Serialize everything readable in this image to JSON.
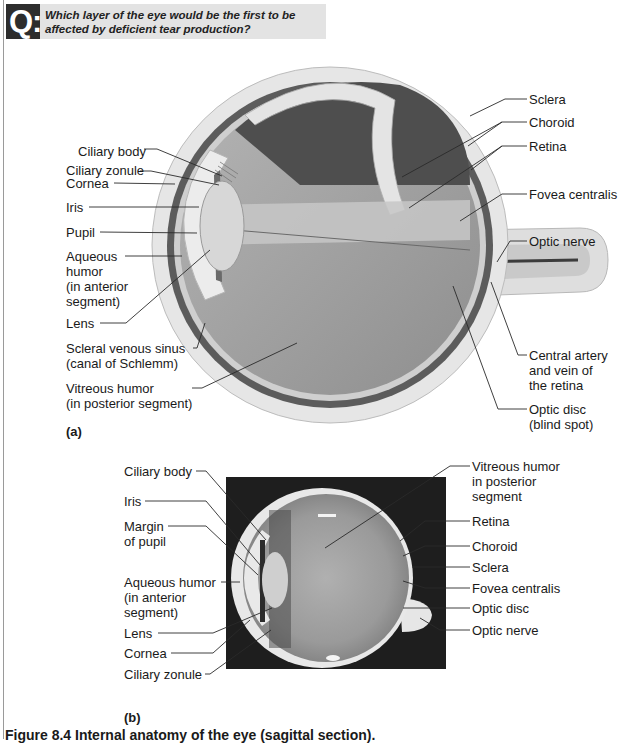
{
  "question": {
    "badge": "Q:",
    "text_line1": "Which layer of the eye would be the first to be",
    "text_line2": "affected by deficient tear production?"
  },
  "figure_a": {
    "panel_label": "(a)",
    "labels_left": [
      {
        "id": "ciliary-body",
        "text": "Ciliary body",
        "x": 78,
        "y": 144
      },
      {
        "id": "ciliary-zonule",
        "text": "Ciliary zonule",
        "x": 66,
        "y": 166
      },
      {
        "id": "cornea",
        "text": "Cornea",
        "x": 66,
        "y": 178
      },
      {
        "id": "iris",
        "text": "Iris",
        "x": 66,
        "y": 202
      },
      {
        "id": "pupil",
        "text": "Pupil",
        "x": 66,
        "y": 228
      },
      {
        "id": "aqueous-humor",
        "text": "Aqueous\nhumor\n(in anterior\nsegment)",
        "x": 66,
        "y": 251
      },
      {
        "id": "lens",
        "text": "Lens",
        "x": 66,
        "y": 318
      },
      {
        "id": "scleral-venous-sinus",
        "text": "Scleral venous sinus\n(canal of Schlemm)",
        "x": 66,
        "y": 343
      },
      {
        "id": "vitreous-humor",
        "text": "Vitreous humor\n(in posterior segment)",
        "x": 66,
        "y": 383
      }
    ],
    "labels_right": [
      {
        "id": "sclera",
        "text": "Sclera",
        "x": 529,
        "y": 94
      },
      {
        "id": "choroid",
        "text": "Choroid",
        "x": 529,
        "y": 117
      },
      {
        "id": "retina",
        "text": "Retina",
        "x": 529,
        "y": 141
      },
      {
        "id": "fovea-centralis",
        "text": "Fovea centralis",
        "x": 529,
        "y": 189
      },
      {
        "id": "optic-nerve",
        "text": "Optic nerve",
        "x": 529,
        "y": 236
      },
      {
        "id": "central-artery-vein",
        "text": "Central artery\nand vein of\nthe retina",
        "x": 529,
        "y": 350
      },
      {
        "id": "optic-disc",
        "text": "Optic disc\n(blind spot)",
        "x": 529,
        "y": 404
      }
    ]
  },
  "figure_b": {
    "panel_label": "(b)",
    "labels_left": [
      {
        "id": "ciliary-body",
        "text": "Ciliary body",
        "x": 124,
        "y": 466
      },
      {
        "id": "iris",
        "text": "Iris",
        "x": 124,
        "y": 496
      },
      {
        "id": "margin-of-pupil",
        "text": "Margin\nof pupil",
        "x": 124,
        "y": 521
      },
      {
        "id": "aqueous-humor",
        "text": "Aqueous humor\n(in anterior\nsegment)",
        "x": 124,
        "y": 577
      },
      {
        "id": "lens",
        "text": "Lens",
        "x": 124,
        "y": 628
      },
      {
        "id": "cornea",
        "text": "Cornea",
        "x": 124,
        "y": 648
      },
      {
        "id": "ciliary-zonule",
        "text": "Ciliary zonule",
        "x": 124,
        "y": 669
      }
    ],
    "labels_right": [
      {
        "id": "vitreous-humor",
        "text": "Vitreous humor\nin posterior\nsegment",
        "x": 472,
        "y": 461
      },
      {
        "id": "retina",
        "text": "Retina",
        "x": 472,
        "y": 516
      },
      {
        "id": "choroid",
        "text": "Choroid",
        "x": 472,
        "y": 541
      },
      {
        "id": "sclera",
        "text": "Sclera",
        "x": 472,
        "y": 562
      },
      {
        "id": "fovea-centralis",
        "text": "Fovea centralis",
        "x": 472,
        "y": 583
      },
      {
        "id": "optic-disc",
        "text": "Optic disc",
        "x": 472,
        "y": 603
      },
      {
        "id": "optic-nerve",
        "text": "Optic nerve",
        "x": 472,
        "y": 625
      }
    ]
  },
  "caption": "Figure 8.4 Internal anatomy of the eye (sagittal section).",
  "colors": {
    "question_bar": "#e3e3e3",
    "badge": "#2d2d2d",
    "sclera": "#e6e6e6",
    "choroid": "#5a5a5a",
    "vitreous": "#9c9c9c",
    "photo_background": "#1e1e1e"
  }
}
